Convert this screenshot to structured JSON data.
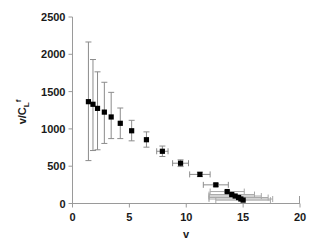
{
  "chart_data": {
    "type": "scatter",
    "title": "",
    "xlabel": "v",
    "ylabel": "v/CL f",
    "ylabel_parts": {
      "main": "v/CL",
      "sub": "L",
      "sup": "f",
      "prefix": "v/C"
    },
    "xlim": [
      0,
      20
    ],
    "ylim": [
      0,
      2500
    ],
    "xticks": [
      0,
      5,
      10,
      15,
      20
    ],
    "yticks": [
      0,
      500,
      1000,
      1500,
      2000,
      2500
    ],
    "xtick_labels": [
      "0",
      "5",
      "10",
      "15",
      "20"
    ],
    "ytick_labels": [
      "0",
      "500",
      "1000",
      "1500",
      "2000",
      "2500"
    ],
    "grid": false,
    "legend": "none",
    "marker_style": "filled-square",
    "marker_color": "#000000",
    "errorbar_color": "#8c8c8c",
    "series": [
      {
        "name": "v/CLf vs v",
        "points": [
          {
            "x": 1.4,
            "y": 1365,
            "yerr_low": 790,
            "yerr_high": 800,
            "xerr": 0
          },
          {
            "x": 1.8,
            "y": 1330,
            "yerr_low": 620,
            "yerr_high": 600,
            "xerr": 0
          },
          {
            "x": 2.2,
            "y": 1275,
            "yerr_low": 555,
            "yerr_high": 490,
            "xerr": 0
          },
          {
            "x": 2.8,
            "y": 1225,
            "yerr_low": 420,
            "yerr_high": 400,
            "xerr": 0
          },
          {
            "x": 3.4,
            "y": 1160,
            "yerr_low": 290,
            "yerr_high": 330,
            "xerr": 0
          },
          {
            "x": 4.2,
            "y": 1075,
            "yerr_low": 205,
            "yerr_high": 205,
            "xerr": 0
          },
          {
            "x": 5.2,
            "y": 975,
            "yerr_low": 135,
            "yerr_high": 140,
            "xerr": 0
          },
          {
            "x": 6.5,
            "y": 855,
            "yerr_low": 100,
            "yerr_high": 105,
            "xerr": 0
          },
          {
            "x": 7.9,
            "y": 700,
            "yerr_low": 70,
            "yerr_high": 70,
            "xerr": 0.5
          },
          {
            "x": 9.5,
            "y": 540,
            "yerr_low": 45,
            "yerr_high": 45,
            "xerr": 0.7
          },
          {
            "x": 11.2,
            "y": 390,
            "yerr_low": 30,
            "yerr_high": 30,
            "xerr": 0.9
          },
          {
            "x": 12.6,
            "y": 250,
            "yerr_low": 20,
            "yerr_high": 20,
            "xerr": 1.1
          },
          {
            "x": 13.6,
            "y": 160,
            "yerr_low": 15,
            "yerr_high": 15,
            "xerr": 1.5
          },
          {
            "x": 14.0,
            "y": 120,
            "yerr_low": 12,
            "yerr_high": 12,
            "xerr": 2.0
          },
          {
            "x": 14.3,
            "y": 100,
            "yerr_low": 10,
            "yerr_high": 10,
            "xerr": 2.3
          },
          {
            "x": 14.6,
            "y": 80,
            "yerr_low": 10,
            "yerr_high": 10,
            "xerr": 2.6
          },
          {
            "x": 14.8,
            "y": 60,
            "yerr_low": 8,
            "yerr_high": 8,
            "xerr": 2.8
          },
          {
            "x": 15.0,
            "y": 45,
            "yerr_low": 8,
            "yerr_high": 8,
            "xerr": 2.4
          }
        ]
      }
    ]
  }
}
